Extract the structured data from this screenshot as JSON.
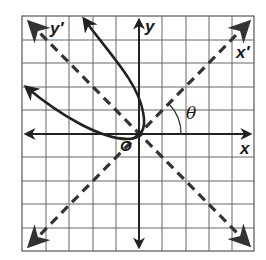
{
  "figure": {
    "type": "rotated-axes-parabola",
    "grid": {
      "cells_x": 10,
      "cells_y": 10,
      "left": 22,
      "top": 16,
      "right": 254,
      "bottom": 251,
      "origin_px": [
        139,
        134
      ],
      "cell_px": 23.5
    },
    "labels": {
      "x_axis": "x",
      "y_axis": "y",
      "x_prime_axis": "x′",
      "y_prime_axis": "y′",
      "angle": "θ",
      "origin": "O"
    },
    "axes": {
      "x_axis": "solid, horizontal, arrows both ends",
      "y_axis": "solid, vertical, arrows both ends",
      "x_prime_axis": "dashed, 45 degrees, arrows both ends",
      "y_prime_axis": "dashed, 135 degrees, arrows both ends"
    },
    "angle_theta_deg": 45,
    "curve": {
      "kind": "parabola",
      "vertex": "origin",
      "opens_toward": "y' (upper-left)",
      "arrows": "both branch ends"
    },
    "colors": {
      "grid": "#555555",
      "ink": "#222222",
      "background": "#ffffff"
    }
  }
}
